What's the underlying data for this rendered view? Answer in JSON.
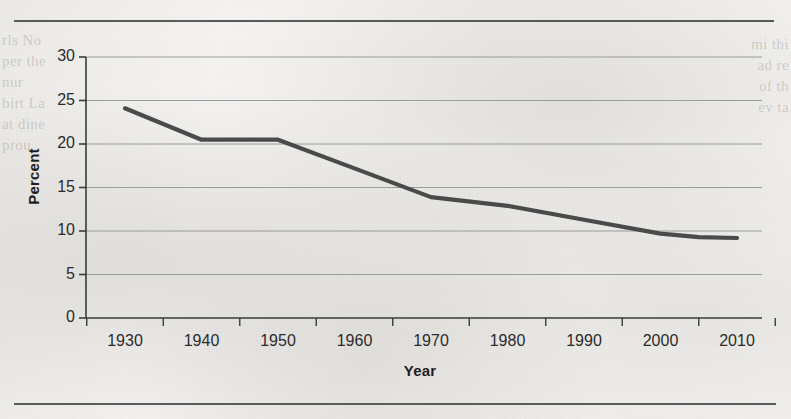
{
  "chart_data": {
    "type": "line",
    "title": "",
    "xlabel": "Year",
    "ylabel": "Percent",
    "x": [
      1930,
      1940,
      1950,
      1960,
      1970,
      1980,
      1990,
      2000,
      2005,
      2010
    ],
    "values": [
      24.1,
      20.5,
      20.5,
      17.2,
      13.9,
      12.9,
      11.3,
      9.7,
      9.3,
      9.2
    ],
    "series": [
      {
        "name": "Percent",
        "values": [
          24.1,
          20.5,
          20.5,
          17.2,
          13.9,
          12.9,
          11.3,
          9.7,
          9.3,
          9.2
        ]
      }
    ],
    "xlim": [
      1925,
      1015
    ],
    "ylim": [
      0,
      30
    ],
    "xticks": [
      1930,
      1940,
      1950,
      1960,
      1970,
      1980,
      1990,
      2000,
      2010
    ],
    "xtick_labels": [
      "1930",
      "1940",
      "1950",
      "1960",
      "1970",
      "1980",
      "1990",
      "2000",
      "2010"
    ],
    "yticks": [
      0,
      5,
      10,
      15,
      20,
      25,
      30
    ],
    "ytick_labels": [
      "0",
      "5",
      "10",
      "15",
      "20",
      "25",
      "30"
    ],
    "grid": "horizontal",
    "legend": "none",
    "line_color": "#4a4a4a",
    "grid_color": "#9a9a9a",
    "axis_color": "#3a3a3a"
  },
  "page": {
    "rule_color": "#5a5a5a",
    "background_color": "#f1f0ed",
    "ghost_text_left": "rls\nNo\nper\nthe\n\nnur\nbirt\nLa\nat\ndine\nprou",
    "ghost_text_right": "mi\nthi\nad\nre\nof\nth\nev\nta"
  }
}
